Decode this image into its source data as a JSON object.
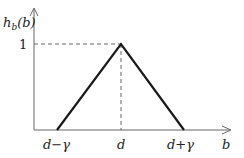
{
  "diagram": {
    "type": "triangular-membership-function",
    "y_axis_label": {
      "main": "h",
      "sub": "b",
      "arg": "(b)"
    },
    "x_axis_label": "b",
    "y_tick_label": "1",
    "x_tick_labels": {
      "left": "d−γ",
      "center": "d",
      "right": "d+γ"
    },
    "colors": {
      "line": "#1a1a1a",
      "axis": "#555555",
      "dashed": "#555555",
      "text": "#222222"
    },
    "points": [
      {
        "label": "d−γ",
        "x": "d-gamma",
        "y": 0
      },
      {
        "label": "d",
        "x": "d",
        "y": 1
      },
      {
        "label": "d+γ",
        "x": "d+gamma",
        "y": 0
      }
    ]
  }
}
